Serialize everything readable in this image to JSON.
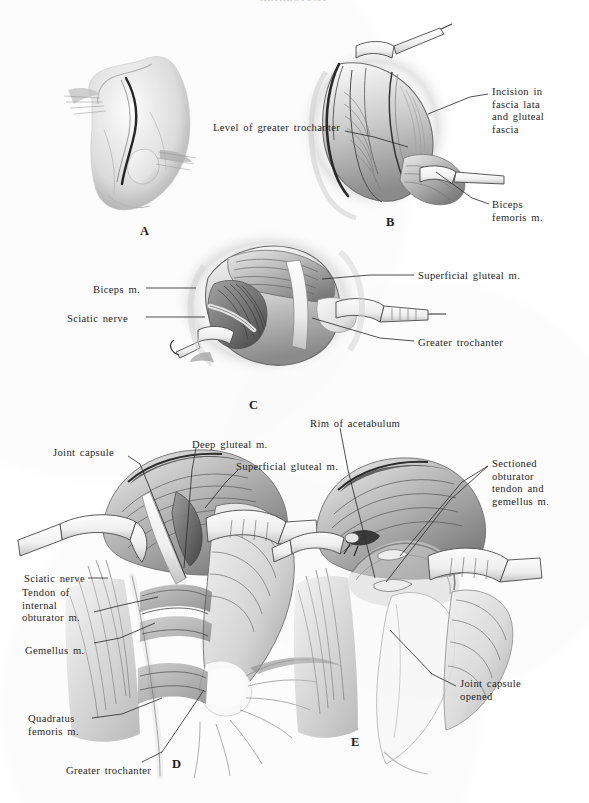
{
  "page": {
    "running_head": "ARTHROTOMY",
    "background_color": "#fefefe",
    "ink_color": "#262626"
  },
  "figure": {
    "type": "surgical-anatomy-illustration",
    "technique": "pen-and-ink wash / halftone",
    "panel_count": 5
  },
  "panels": [
    {
      "id": "A",
      "letter": "A",
      "letter_pos": {
        "x": 140,
        "y": 224
      },
      "caption": "Skin incision over the greater trochanter",
      "labels": []
    },
    {
      "id": "B",
      "letter": "B",
      "letter_pos": {
        "x": 386,
        "y": 215
      },
      "caption": "Fascial incision exposing the gluteal musculature",
      "labels": [
        {
          "name": "level-of-greater-trochanter",
          "text": "Level of greater trochanter",
          "x": 213,
          "y": 122,
          "align": "left",
          "leader": [
            [
              345,
              131
            ],
            [
              374,
              137
            ],
            [
              408,
              147
            ]
          ]
        },
        {
          "name": "incision-in-fascia-lata-and-gluteal-fascia",
          "text": "Incision in\nfascia lata\nand gluteal\nfascia",
          "x": 492,
          "y": 86,
          "align": "left",
          "leader": [
            [
              488,
              94
            ],
            [
              470,
              97
            ],
            [
              428,
              114
            ]
          ]
        },
        {
          "name": "biceps-femoris-m",
          "text": "Biceps\nfemoris m.",
          "x": 492,
          "y": 199,
          "align": "left",
          "leader": [
            [
              489,
              204
            ],
            [
              472,
              198
            ],
            [
              436,
              172
            ]
          ]
        }
      ]
    },
    {
      "id": "C",
      "letter": "C",
      "letter_pos": {
        "x": 249,
        "y": 398
      },
      "caption": "Retracted field showing sciatic nerve and trochanter",
      "labels": [
        {
          "name": "biceps-m",
          "text": "Biceps m.",
          "x": 140,
          "y": 284,
          "align": "right",
          "leader": [
            [
              146,
              288
            ],
            [
              196,
              288
            ]
          ]
        },
        {
          "name": "sciatic-nerve",
          "text": "Sciatic nerve",
          "x": 128,
          "y": 313,
          "align": "right",
          "leader": [
            [
              146,
              317
            ],
            [
              205,
              317
            ]
          ]
        },
        {
          "name": "superficial-gluteal-m",
          "text": "Superficial gluteal m.",
          "x": 418,
          "y": 270,
          "align": "left",
          "leader": [
            [
              414,
              275
            ],
            [
              370,
              275
            ],
            [
              322,
              279
            ]
          ]
        },
        {
          "name": "greater-trochanter",
          "text": "Greater trochanter",
          "x": 418,
          "y": 337,
          "align": "left",
          "leader": [
            [
              414,
              341
            ],
            [
              380,
              338
            ],
            [
              312,
              318
            ]
          ]
        }
      ]
    },
    {
      "id": "D",
      "letter": "D",
      "letter_pos": {
        "x": 172,
        "y": 757
      },
      "caption": "Deep dissection: short external rotators exposed",
      "labels": [
        {
          "name": "joint-capsule",
          "text": "Joint capsule",
          "x": 53,
          "y": 447,
          "align": "left",
          "leader": [
            [
              128,
              456
            ],
            [
              140,
              464
            ],
            [
              186,
              578
            ]
          ]
        },
        {
          "name": "deep-gluteal-m",
          "text": "Deep gluteal m.",
          "x": 192,
          "y": 439,
          "align": "left",
          "leader": [
            [
              196,
              448
            ],
            [
              192,
              470
            ],
            [
              184,
              568
            ]
          ]
        },
        {
          "name": "superficial-gluteal-m-d",
          "text": "Superficial gluteal m.",
          "x": 236,
          "y": 461,
          "align": "left",
          "leader": [
            [
              238,
              470
            ],
            [
              226,
              482
            ],
            [
              205,
              508
            ]
          ]
        },
        {
          "name": "sciatic-nerve-d",
          "text": "Sciatic nerve",
          "x": 85,
          "y": 573,
          "align": "right",
          "leader": [
            [
              88,
              578
            ],
            [
              108,
              578
            ]
          ]
        },
        {
          "name": "tendon-of-internal-obturator-m",
          "text": "Tendon of\ninternal\nobturator m.",
          "x": 22,
          "y": 587,
          "align": "left",
          "leader": [
            [
              94,
              612
            ],
            [
              118,
              606
            ],
            [
              158,
              597
            ]
          ]
        },
        {
          "name": "gemellus-m",
          "text": "Gemellus m.",
          "x": 25,
          "y": 645,
          "align": "left",
          "leader": [
            [
              94,
              643
            ],
            [
              120,
              638
            ],
            [
              155,
              623
            ]
          ]
        },
        {
          "name": "quadratus-femoris-m",
          "text": "Quadratus\nfemoris m.",
          "x": 28,
          "y": 713,
          "align": "left",
          "leader": [
            [
              92,
              718
            ],
            [
              122,
              714
            ],
            [
              162,
              698
            ]
          ]
        },
        {
          "name": "greater-trochanter-d",
          "text": "Greater trochanter",
          "x": 66,
          "y": 765,
          "align": "left",
          "leader": [
            [
              142,
              762
            ],
            [
              162,
              752
            ],
            [
              204,
              690
            ]
          ]
        }
      ]
    },
    {
      "id": "E",
      "letter": "E",
      "letter_pos": {
        "x": 351,
        "y": 735
      },
      "caption": "Obturator tendon sectioned; joint capsule opened",
      "labels": [
        {
          "name": "rim-of-acetabulum",
          "text": "Rim of acetabulum",
          "x": 310,
          "y": 418,
          "align": "left",
          "leader": [
            [
              340,
              428
            ],
            [
              348,
              470
            ],
            [
              375,
              578
            ]
          ]
        },
        {
          "name": "sectioned-obturator-tendon-and-gemellus-m",
          "text": "Sectioned\nobturator\ntendon and\ngemellus m.",
          "x": 492,
          "y": 458,
          "align": "left",
          "leader": [
            [
              488,
              466
            ],
            [
              462,
              482
            ],
            [
              400,
              556
            ]
          ]
        },
        {
          "name": "sectioned-obturator-branch-2",
          "text": "",
          "x": 0,
          "y": 0,
          "align": "left",
          "leader": [
            [
              488,
              466
            ],
            [
              450,
              500
            ],
            [
              386,
              582
            ]
          ]
        },
        {
          "name": "joint-capsule-opened",
          "text": "Joint capsule\nopened",
          "x": 460,
          "y": 678,
          "align": "left",
          "leader": [
            [
              456,
              686
            ],
            [
              432,
              674
            ],
            [
              390,
              630
            ]
          ]
        }
      ]
    }
  ]
}
